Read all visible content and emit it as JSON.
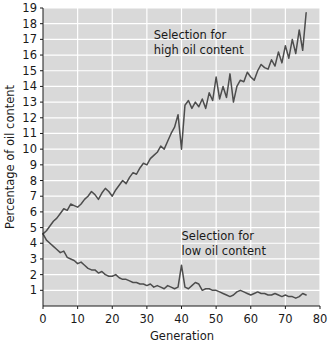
{
  "chart_data": {
    "type": "line",
    "title": "",
    "xlabel": "Generation",
    "ylabel": "Percentage of oil content",
    "xlim": [
      0,
      80
    ],
    "ylim": [
      0,
      19
    ],
    "xticks": [
      0,
      10,
      20,
      30,
      40,
      50,
      60,
      70,
      80
    ],
    "yticks": [
      1,
      2,
      3,
      4,
      5,
      6,
      7,
      8,
      9,
      10,
      11,
      12,
      13,
      14,
      15,
      16,
      17,
      18,
      19
    ],
    "grid": true,
    "legend_position": "inline-annotations",
    "annotations": [
      {
        "name": "high-series-annotation",
        "text_line1": "Selection for",
        "text_line2": "high oil content",
        "x": 32,
        "y": 17.0
      },
      {
        "name": "low-series-annotation",
        "text_line1": "Selection for",
        "text_line2": "low oil content",
        "x": 40,
        "y": 4.2
      }
    ],
    "colors": {
      "plot_background": "#d9d9d9",
      "gridlines": "#ffffff",
      "series_line": "#4d4d4d",
      "axis_text": "#1a1a1a",
      "page_background": "#ffffff"
    },
    "series": [
      {
        "name": "Selection for high oil content",
        "x": [
          0,
          1,
          2,
          3,
          4,
          5,
          6,
          7,
          8,
          9,
          10,
          11,
          12,
          13,
          14,
          15,
          16,
          17,
          18,
          19,
          20,
          21,
          22,
          23,
          24,
          25,
          26,
          27,
          28,
          29,
          30,
          31,
          32,
          33,
          34,
          35,
          36,
          37,
          38,
          39,
          40,
          41,
          42,
          43,
          44,
          45,
          46,
          47,
          48,
          49,
          50,
          51,
          52,
          53,
          54,
          55,
          56,
          57,
          58,
          59,
          60,
          61,
          62,
          63,
          64,
          65,
          66,
          67,
          68,
          69,
          70,
          71,
          72,
          73,
          74,
          75,
          76
        ],
        "values": [
          4.6,
          4.8,
          5.1,
          5.4,
          5.6,
          5.9,
          6.2,
          6.1,
          6.5,
          6.4,
          6.3,
          6.5,
          6.8,
          7.0,
          7.3,
          7.1,
          6.8,
          7.2,
          7.5,
          7.3,
          7.0,
          7.4,
          7.7,
          8.0,
          7.8,
          8.2,
          8.5,
          8.4,
          8.8,
          9.1,
          9.0,
          9.4,
          9.6,
          9.8,
          10.2,
          10.0,
          10.5,
          11.0,
          11.4,
          12.2,
          10.0,
          12.8,
          13.1,
          12.6,
          13.0,
          12.7,
          13.2,
          12.6,
          13.6,
          13.1,
          14.6,
          13.2,
          14.0,
          13.3,
          14.8,
          13.0,
          14.0,
          14.4,
          14.3,
          14.9,
          14.6,
          14.4,
          15.0,
          15.4,
          15.2,
          15.1,
          15.7,
          15.3,
          16.2,
          15.5,
          16.6,
          15.8,
          17.0,
          16.1,
          17.6,
          16.3,
          18.7
        ]
      },
      {
        "name": "Selection for low oil content",
        "x": [
          0,
          1,
          2,
          3,
          4,
          5,
          6,
          7,
          8,
          9,
          10,
          11,
          12,
          13,
          14,
          15,
          16,
          17,
          18,
          19,
          20,
          21,
          22,
          23,
          24,
          25,
          26,
          27,
          28,
          29,
          30,
          31,
          32,
          33,
          34,
          35,
          36,
          37,
          38,
          39,
          40,
          41,
          42,
          43,
          44,
          45,
          46,
          47,
          48,
          49,
          50,
          51,
          52,
          53,
          54,
          55,
          56,
          57,
          58,
          59,
          60,
          61,
          62,
          63,
          64,
          65,
          66,
          67,
          68,
          69,
          70,
          71,
          72,
          73,
          74,
          75,
          76
        ],
        "values": [
          4.6,
          4.2,
          4.0,
          3.8,
          3.6,
          3.4,
          3.5,
          3.1,
          3.0,
          2.9,
          2.7,
          2.8,
          2.6,
          2.4,
          2.3,
          2.3,
          2.1,
          2.2,
          2.0,
          1.9,
          1.9,
          2.0,
          1.8,
          1.7,
          1.7,
          1.6,
          1.5,
          1.5,
          1.4,
          1.4,
          1.3,
          1.4,
          1.2,
          1.3,
          1.2,
          1.1,
          1.3,
          1.2,
          1.1,
          1.2,
          2.6,
          1.2,
          1.1,
          1.3,
          1.5,
          1.4,
          1.0,
          1.1,
          1.1,
          1.0,
          1.0,
          0.9,
          0.8,
          0.7,
          0.6,
          0.7,
          0.9,
          1.0,
          0.9,
          0.8,
          0.7,
          0.8,
          0.9,
          0.8,
          0.8,
          0.7,
          0.7,
          0.8,
          0.7,
          0.6,
          0.7,
          0.6,
          0.6,
          0.5,
          0.6,
          0.8,
          0.7
        ]
      }
    ]
  }
}
